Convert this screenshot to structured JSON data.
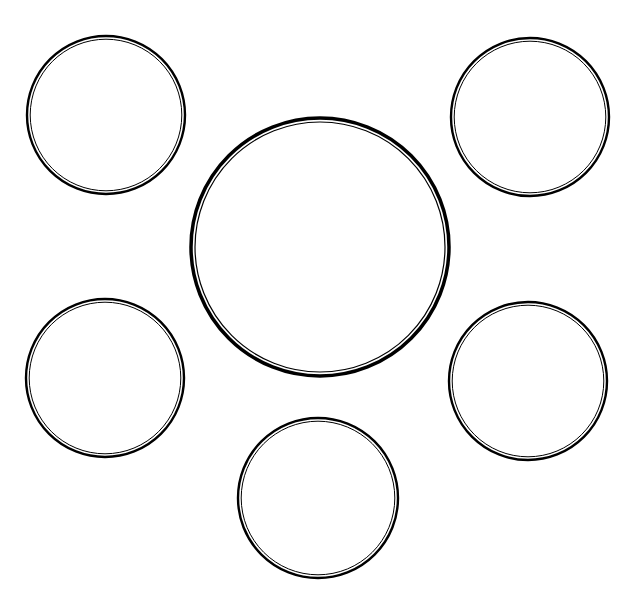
{
  "diagram": {
    "type": "bubble-map",
    "background": "#ffffff",
    "stroke_color": "#000000",
    "center_node": {
      "cx": 320,
      "cy": 247,
      "r": 129,
      "outer_stroke": 3.5,
      "inner_stroke": 1.2,
      "label": ""
    },
    "satellite_nodes": [
      {
        "id": "top-left",
        "cx": 106,
        "cy": 115,
        "r": 79,
        "label": ""
      },
      {
        "id": "top-right",
        "cx": 530,
        "cy": 117,
        "r": 79,
        "label": ""
      },
      {
        "id": "bottom-left",
        "cx": 105,
        "cy": 378,
        "r": 79,
        "label": ""
      },
      {
        "id": "bottom-right",
        "cx": 528,
        "cy": 381,
        "r": 79,
        "label": ""
      },
      {
        "id": "bottom-center",
        "cx": 318,
        "cy": 498,
        "r": 80,
        "label": ""
      }
    ]
  }
}
